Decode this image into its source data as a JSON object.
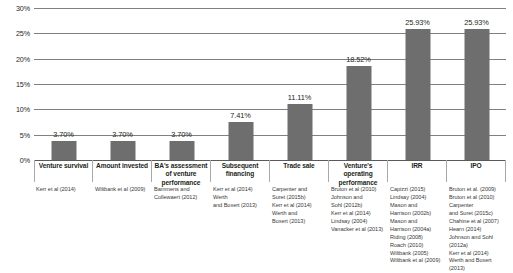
{
  "chart_data": {
    "type": "bar",
    "title": "",
    "xlabel": "",
    "ylabel": "",
    "ylim": [
      0,
      30
    ],
    "grid": true,
    "legend": "none",
    "bar_color": "#6e6e6e",
    "yticks": [
      "0%",
      "5%",
      "10%",
      "15%",
      "20%",
      "25%",
      "30%"
    ],
    "ytick_values": [
      0,
      5,
      10,
      15,
      20,
      25,
      30
    ],
    "categories": [
      "Venture survival",
      "Amount invested",
      "BA's assessment of venture performance",
      "Subsequent financing",
      "Trade sale",
      "Venture's operating performance",
      "IRR",
      "IPO"
    ],
    "values": [
      3.7,
      3.7,
      3.7,
      7.41,
      11.11,
      18.52,
      25.93,
      25.93
    ],
    "data_labels": [
      "3.70%",
      "3.70%",
      "3.70%",
      "7.41%",
      "11.11%",
      "18.52%",
      "25.93%",
      "25.93%"
    ],
    "citations": [
      "Kerr et al (2014)",
      "Wiltbank et al (2009)",
      "Bammens and\nCollewaert (2012)",
      "Kerr et al (2014)\nWerth\nand Boxert (2013)",
      "Carpenter and\nSuret (2015b)\nKerr et al (2014)\nWerth and\nBoxert (2013)",
      "Bruton et al (2010)\nJohnson and\nSohl (2012b)\nKerr et al (2014)\nLindsay (2004)\nVanacker et al (2013)",
      "Capizzi (2015)\nLindsay (2004)\nMason and\nHarrison (2002b)\nMason and\nHarrison (2004a)\nRiding (2008)\nRoach (2010)\nWiltbank (2005)\nWiltbank et al (2009)",
      "Bruton et al. (2009)\nBruton et al (2010)\nCarpenter\nand Suret (2015c)\nChahine et al (2007)\nHearn (2014)\nJohnson and Sohl (2012a)\nKerr et al (2014)\nWerth and Boxert (2013)"
    ]
  }
}
